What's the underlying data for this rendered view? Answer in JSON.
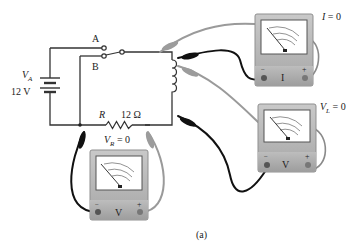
{
  "figure": {
    "caption": "(a)"
  },
  "circuit": {
    "battery": {
      "symbol": "V",
      "subscript": "A",
      "value": "12  V"
    },
    "switch": {
      "position_a": "A",
      "position_b": "B"
    },
    "resistor": {
      "symbol": "R",
      "value": "12  Ω"
    },
    "resistor_voltage": {
      "symbol": "V",
      "subscript": "R",
      "equals": " = 0"
    },
    "inductor_voltage": {
      "symbol": "V",
      "subscript": "L",
      "equals": " = 0"
    },
    "current": {
      "symbol": "I",
      "equals": " = 0"
    }
  },
  "meters": [
    {
      "id": "ammeter",
      "face_label": "I",
      "minus": "−",
      "plus": "+"
    },
    {
      "id": "voltmeter-inductor",
      "face_label": "V",
      "minus": "−",
      "plus": "+"
    },
    {
      "id": "voltmeter-resistor",
      "face_label": "V",
      "minus": "−",
      "plus": "+"
    }
  ],
  "colors": {
    "wire": "#333333",
    "lead_black": "#111111",
    "lead_gray": "#9a9a9a",
    "meter_body": "#b9b9b9",
    "meter_face": "#ffffff"
  }
}
